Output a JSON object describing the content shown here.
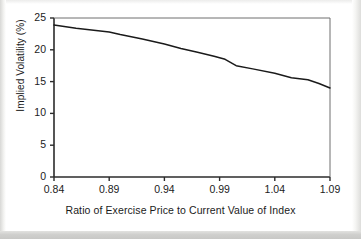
{
  "figure": {
    "background_color": "#ffffff",
    "line_color": "#1a1a1a",
    "axis_color": "#333333",
    "text_color": "#1b1b1b"
  },
  "chart_data": {
    "type": "line",
    "title": "",
    "subtitle": "",
    "xlabel": "Ratio of Exercise Price to Current Value of Index",
    "ylabel": "Implied Volatility (%)",
    "xlim": [
      0.84,
      1.09
    ],
    "ylim": [
      0,
      25
    ],
    "xticks": [
      "0.84",
      "0.89",
      "0.94",
      "0.99",
      "1.04",
      "1.09"
    ],
    "xtick_values": [
      0.84,
      0.89,
      0.94,
      0.99,
      1.04,
      1.09
    ],
    "yticks": [
      "0",
      "5",
      "10",
      "15",
      "20",
      "25"
    ],
    "ytick_values": [
      0,
      5,
      10,
      15,
      20,
      25
    ],
    "grid": false,
    "legend": false,
    "legend_position": "none",
    "x": [
      0.84,
      0.86,
      0.88,
      0.89,
      0.9,
      0.92,
      0.94,
      0.955,
      0.97,
      0.985,
      0.995,
      1.005,
      1.02,
      1.04,
      1.055,
      1.07,
      1.08,
      1.09
    ],
    "series": [
      {
        "name": "Implied Volatility",
        "values": [
          23.9,
          23.4,
          23.0,
          22.8,
          22.4,
          21.7,
          20.9,
          20.2,
          19.6,
          19.0,
          18.5,
          17.5,
          17.0,
          16.3,
          15.6,
          15.3,
          14.7,
          14.0
        ]
      }
    ]
  }
}
